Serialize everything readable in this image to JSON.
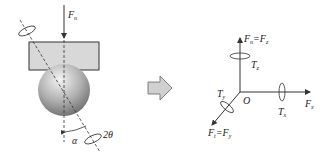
{
  "left_panel": {
    "force_label": "F",
    "force_sub": "n",
    "angle_alpha": "α",
    "angle_2theta": "2θ"
  },
  "arrow": {
    "icon": "right-arrow-icon",
    "fill": "#d0d0d0"
  },
  "right_panel": {
    "origin": "O",
    "z_force": {
      "main": "F",
      "sub1": "n",
      "eq": "=F",
      "sub2": "z"
    },
    "z_torque": {
      "main": "T",
      "sub": "z"
    },
    "x_force": {
      "main": "F",
      "sub": "x"
    },
    "x_torque": {
      "main": "T",
      "sub": "x"
    },
    "y_force": {
      "main": "F",
      "sub1": "t",
      "eq": "=F",
      "sub2": "y"
    },
    "y_torque": {
      "main": "T",
      "sub": "y"
    }
  },
  "colors": {
    "plate": "#d8d8d8",
    "sphere_light": "#e8e8e8",
    "sphere_dark": "#7a7a7a",
    "line": "#333333"
  }
}
